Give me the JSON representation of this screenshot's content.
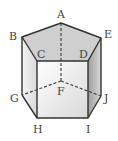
{
  "diagram": {
    "type": "pentagonal-prism",
    "vertices": {
      "top_face": [
        "A",
        "B",
        "C",
        "D",
        "E"
      ],
      "bottom_face": [
        "F",
        "G",
        "H",
        "I",
        "J"
      ]
    },
    "labels": {
      "A": "A",
      "B": "B",
      "C": "C",
      "D": "D",
      "E": "E",
      "F": "F",
      "G": "G",
      "H": "H",
      "I": "I",
      "J": "J"
    },
    "hidden_edges": [
      "AF",
      "FG",
      "FJ"
    ],
    "colors": {
      "top_face": "#cfcfcf",
      "front_face": "#f2f2f2",
      "left_face": "#e3e3e3",
      "right_face": "#bdbdbd",
      "edge": "#333333"
    }
  }
}
